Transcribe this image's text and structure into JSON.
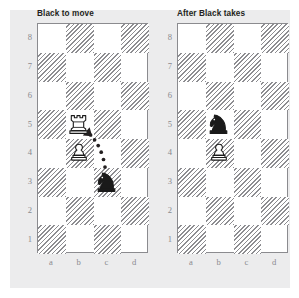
{
  "figure": {
    "background_color": "#ffffff",
    "panel_color": "#ececed",
    "dark_square_hatch_color": "#8d8d91",
    "light_square_color": "#ffffff",
    "board_border_color": "#8b8b8f",
    "label_color": "#8a8a8e",
    "title_color": "#231f20",
    "piece_black_color": "#1a1a1a",
    "piece_white_color": "#ffffff",
    "arrow_color": "#231f20"
  },
  "boards": [
    {
      "id": "left-board",
      "title": "Black to move",
      "files": [
        "a",
        "b",
        "c",
        "d"
      ],
      "ranks": [
        "8",
        "7",
        "6",
        "5",
        "4",
        "3",
        "2",
        "1"
      ],
      "pieces": [
        {
          "square": "b5",
          "file": "b",
          "rank": "5",
          "piece": "rook",
          "color": "white",
          "name": "white-rook-b5"
        },
        {
          "square": "b4",
          "file": "b",
          "rank": "4",
          "piece": "pawn",
          "color": "white",
          "name": "white-pawn-b4"
        },
        {
          "square": "c3",
          "file": "c",
          "rank": "3",
          "piece": "knight",
          "color": "black",
          "name": "black-knight-c3"
        }
      ],
      "arrow": {
        "from": "c3",
        "to": "b5",
        "style": "dotted-curved",
        "name": "move-arrow-c3-b5"
      }
    },
    {
      "id": "right-board",
      "title": "After Black takes",
      "files": [
        "a",
        "b",
        "c",
        "d"
      ],
      "ranks": [
        "8",
        "7",
        "6",
        "5",
        "4",
        "3",
        "2",
        "1"
      ],
      "pieces": [
        {
          "square": "b5",
          "file": "b",
          "rank": "5",
          "piece": "knight",
          "color": "black",
          "name": "black-knight-b5"
        },
        {
          "square": "b4",
          "file": "b",
          "rank": "4",
          "piece": "pawn",
          "color": "white",
          "name": "white-pawn-b4"
        }
      ],
      "arrow": null
    }
  ]
}
